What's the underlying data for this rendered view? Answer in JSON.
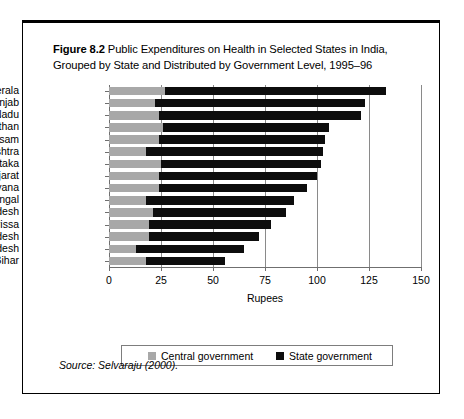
{
  "caption": {
    "figure_number": "Figure 8.2",
    "text": " Public Expenditures on Health in Selected States in India, Grouped by State and Distributed by Government Level, 1995–96"
  },
  "source": {
    "label": "Source:",
    "reference": " Selvaraju (2000)."
  },
  "legend": {
    "central_label": "Central government",
    "state_label": "State government"
  },
  "colors": {
    "central": "#a8a8a8",
    "state": "#0d0d0d",
    "grid": "#8a8a8a",
    "axis": "#6f6f6f",
    "frame": "#000000"
  },
  "chart_data": {
    "type": "bar",
    "orientation": "horizontal",
    "stacked": true,
    "title": "Figure 8.2 Public Expenditures on Health in Selected States in India, Grouped by State and Distributed by Government Level, 1995–96",
    "xlabel": "Rupees",
    "ylabel": "",
    "xlim": [
      0,
      150
    ],
    "xticks": [
      0,
      25,
      50,
      75,
      100,
      125,
      150
    ],
    "xtick_labels": [
      "0",
      "25",
      "50",
      "75",
      "100",
      "125",
      "150"
    ],
    "grid": true,
    "grid_axis": "x",
    "legend_position": "bottom",
    "categories": [
      "Kerala",
      "Punjab",
      "Tamil Nadu",
      "Rajasthan",
      "Assam",
      "Maharashtra",
      "Karnataka",
      "Gujarat",
      "Haryana",
      "West Bengal",
      "Andhra Pradesh",
      "Orissa",
      "Uttar Pradesh",
      "Madhya Pradesh",
      "Bihar"
    ],
    "series": [
      {
        "name": "Central government",
        "color": "#a8a8a8",
        "values": [
          27,
          22,
          24,
          26,
          24,
          18,
          25,
          24,
          24,
          18,
          21,
          19,
          19,
          13,
          18
        ]
      },
      {
        "name": "State government",
        "color": "#0d0d0d",
        "values": [
          106,
          101,
          97,
          80,
          80,
          85,
          77,
          76,
          71,
          71,
          64,
          59,
          53,
          52,
          38
        ]
      }
    ],
    "totals": [
      133,
      123,
      121,
      106,
      104,
      103,
      102,
      100,
      95,
      89,
      85,
      78,
      72,
      65,
      56
    ]
  }
}
